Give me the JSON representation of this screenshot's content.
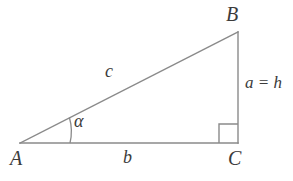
{
  "figure": {
    "type": "right-triangle-diagram",
    "background_color": "#ffffff",
    "stroke_color": "#8a8a8a",
    "text_color": "#3b3b3b",
    "vertices": {
      "A": {
        "label": "A",
        "x": 20,
        "y": 143
      },
      "B": {
        "label": "B",
        "x": 238,
        "y": 32
      },
      "C": {
        "label": "C",
        "x": 238,
        "y": 143
      }
    },
    "sides": {
      "base": {
        "label": "b",
        "from": "A",
        "to": "C"
      },
      "hypotenuse": {
        "label": "c",
        "from": "A",
        "to": "B"
      },
      "vertical": {
        "label": "a = h",
        "from": "B",
        "to": "C"
      }
    },
    "angles": {
      "at_A": {
        "label": "α",
        "arc_radius": 50
      },
      "at_C": {
        "label": "right-angle",
        "marker_size": 19
      }
    }
  }
}
